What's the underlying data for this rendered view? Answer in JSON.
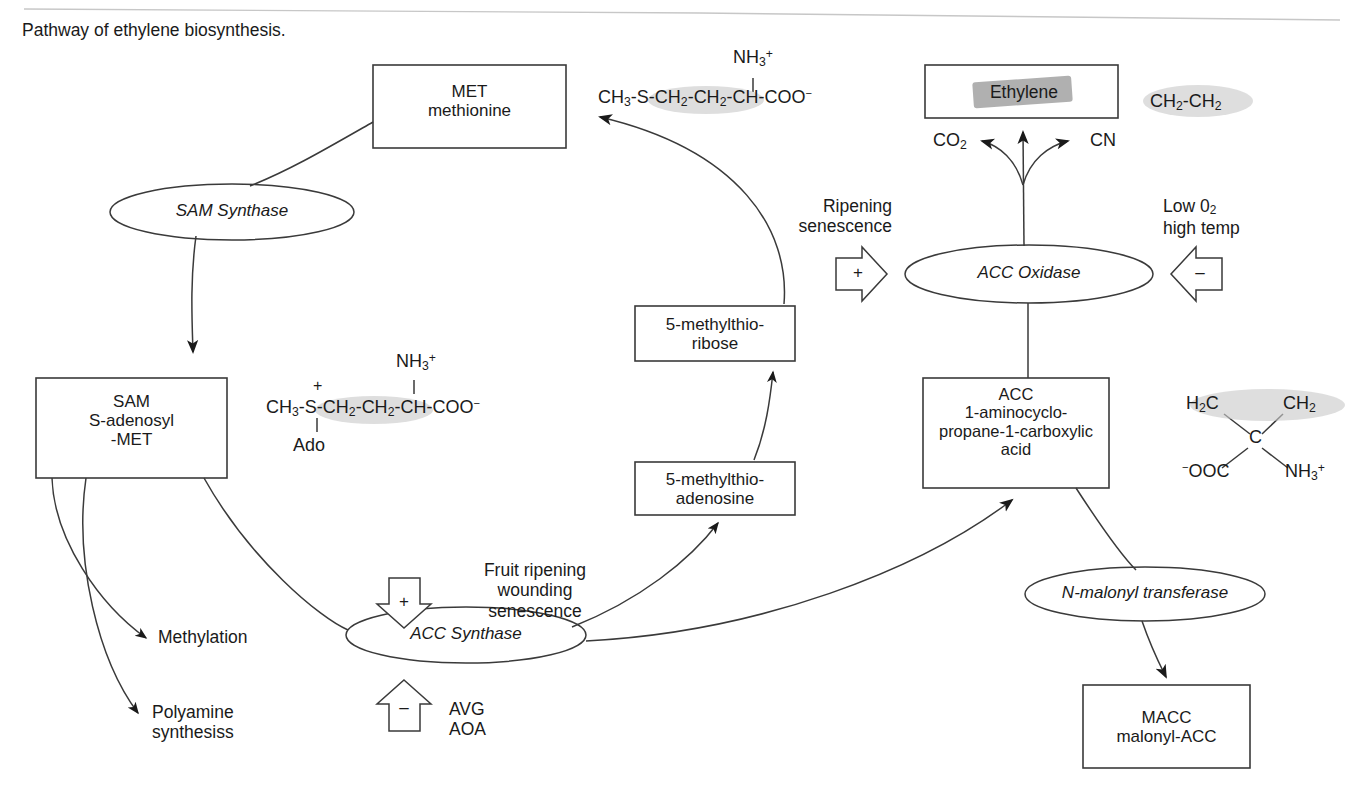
{
  "caption": "Pathway of ethylene biosynthesis.",
  "boxes": {
    "met": {
      "line1": "MET",
      "line2": "methionine"
    },
    "sam": {
      "line1": "SAM",
      "line2": "S-adenosyl",
      "line3": "-MET"
    },
    "mtribose": {
      "line1": "5-methylthio-",
      "line2": "ribose"
    },
    "mtadenosine": {
      "line1": "5-methylthio-",
      "line2": "adenosine"
    },
    "acc": {
      "line1": "ACC",
      "line2": "1-aminocyclo-",
      "line3": "propane-1-carboxylic",
      "line4": "acid"
    },
    "ethylene": {
      "line1": "Ethylene"
    },
    "macc": {
      "line1": "MACC",
      "line2": "malonyl-ACC"
    }
  },
  "enzymes": {
    "sam_synthase": "SAM Synthase",
    "acc_synthase": "ACC Synthase",
    "acc_oxidase": "ACC Oxidase",
    "n_malonyl_transferase": "N-malonyl transferase"
  },
  "regulators": {
    "acc_synthase_plus": {
      "sign": "+",
      "line1": "Fruit ripening",
      "line2": "wounding",
      "line3": "senescence"
    },
    "acc_synthase_minus": {
      "sign": "–",
      "line1": "AVG",
      "line2": "AOA"
    },
    "acc_oxidase_plus": {
      "sign": "+",
      "line1": "Ripening",
      "line2": "senescence"
    },
    "acc_oxidase_minus": {
      "sign": "–",
      "line1": "Low 0",
      "line1_sub": "2",
      "line2": "high temp"
    }
  },
  "products": {
    "methylation": "Methylation",
    "polyamine_line1": "Polyamine",
    "polyamine_line2": "synthesiss",
    "co2": "CO",
    "co2_sub": "2",
    "cn": "CN"
  },
  "formulas": {
    "methionine": {
      "chain": "CH3-S-CH2-CH2-CH-COO",
      "parts": [
        "CH",
        "3",
        "-S-",
        "CH",
        "2",
        "-",
        "CH",
        "2",
        "-CH-COO"
      ],
      "charge_nh3": "NH3+",
      "charge_coo": "−",
      "nh3_text": "NH",
      "nh3_sub": "3",
      "nh3_sup": "+"
    },
    "sam": {
      "s_charge": "+",
      "ado": "Ado",
      "nh3_text": "NH",
      "nh3_sub": "3",
      "nh3_sup": "+",
      "coo_charge": "−"
    },
    "ethylene": {
      "text": "CH2-CH2",
      "a": "CH",
      "a_sub": "2",
      "dash": "-",
      "b": "CH",
      "b_sub": "2"
    },
    "acc": {
      "top_left": "H2C",
      "top_left_a": "H",
      "top_left_sub": "2",
      "top_left_b": "C",
      "top_right": "CH2",
      "top_right_a": "CH",
      "top_right_sub": "2",
      "center": "C",
      "bottom_left_charge": "−",
      "bottom_left": "OOC",
      "bottom_right": "NH3+",
      "bottom_right_a": "NH",
      "bottom_right_sub": "3",
      "bottom_right_sup": "+"
    }
  },
  "colors": {
    "stroke": "#3a3a3a",
    "text": "#1a1a1a",
    "highlight": "#c9c9c9",
    "highlight_dark": "#9a9a9a"
  }
}
